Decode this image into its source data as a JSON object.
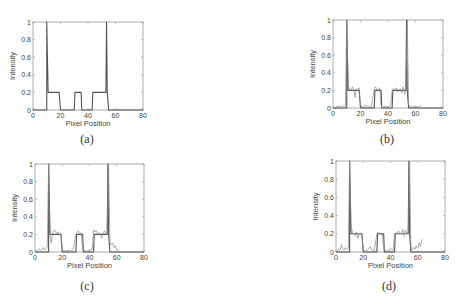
{
  "figure": {
    "panels": [
      {
        "id": "a",
        "caption": "(a)"
      },
      {
        "id": "b",
        "caption": "(b)"
      },
      {
        "id": "c",
        "caption": "(c)"
      },
      {
        "id": "d",
        "caption": "(d)"
      }
    ]
  },
  "chart_data": [
    {
      "type": "line",
      "panel": "(a)",
      "title": "",
      "xlabel": "Pixel Position",
      "ylabel": "Intensity",
      "xlim": [
        0,
        80
      ],
      "ylim": [
        0,
        1
      ],
      "xticks": [
        0,
        20,
        40,
        60,
        80
      ],
      "yticks": [
        0,
        0.2,
        0.4,
        0.6,
        0.8,
        1
      ],
      "ytick_labels": [
        "0",
        "0.2",
        "0.4",
        "0.6",
        "0.8",
        "1"
      ],
      "grid": false,
      "series": [
        {
          "name": "ideal profile",
          "x": [
            0,
            10,
            10,
            11,
            12,
            19,
            20,
            30,
            30.5,
            35,
            35.5,
            43,
            43.5,
            53,
            53.5,
            54,
            55,
            80
          ],
          "y": [
            0,
            0,
            1,
            0.2,
            0.2,
            0.2,
            0,
            0,
            0.2,
            0.2,
            0,
            0,
            0.2,
            0.2,
            1,
            0.2,
            0,
            0
          ]
        }
      ]
    },
    {
      "type": "line",
      "panel": "(b)",
      "title": "",
      "xlabel": "Pixel Position",
      "ylabel": "Intensity",
      "xlim": [
        0,
        80
      ],
      "ylim": [
        0,
        1
      ],
      "xticks": [
        0,
        20,
        40,
        60,
        80
      ],
      "yticks": [
        0,
        0.2,
        0.4,
        0.6,
        0.8,
        1
      ],
      "ytick_labels": [
        "0",
        "0.2",
        "0.4",
        "0.6",
        "0.8",
        "1"
      ],
      "grid": false,
      "series": [
        {
          "name": "ideal profile",
          "x": [
            0,
            10,
            10,
            11,
            12,
            19,
            20,
            30,
            30.5,
            35,
            35.5,
            43,
            43.5,
            53,
            53.5,
            54,
            55,
            80
          ],
          "y": [
            0,
            0,
            1,
            0.2,
            0.2,
            0.2,
            0,
            0,
            0.2,
            0.2,
            0,
            0,
            0.2,
            0.2,
            1,
            0.2,
            0,
            0
          ]
        },
        {
          "name": "reconstruction",
          "x": [
            0,
            2,
            4,
            6,
            8,
            9,
            10,
            11,
            12,
            13,
            14,
            15,
            16,
            17,
            18,
            19,
            20,
            22,
            24,
            26,
            28,
            30,
            31,
            32,
            33,
            34,
            35,
            36,
            38,
            40,
            42,
            43,
            44,
            45,
            46,
            47,
            48,
            49,
            50,
            51,
            52,
            53,
            54,
            55,
            56,
            58,
            60,
            62,
            64
          ],
          "y": [
            0,
            0.01,
            0.02,
            0.01,
            0.03,
            0.02,
            1,
            0.25,
            0.22,
            0.2,
            0.24,
            0.21,
            0.12,
            0.22,
            0.2,
            0.23,
            0.02,
            0.01,
            0.03,
            0.01,
            0.02,
            0.22,
            0.24,
            0.2,
            0.21,
            0.23,
            0.02,
            0.01,
            0.02,
            0.01,
            0.03,
            0.21,
            0.22,
            0.2,
            0.23,
            0.18,
            0.21,
            0.22,
            0.17,
            0.24,
            0.15,
            0.22,
            1,
            0.03,
            0.02,
            0.01,
            0.02,
            0.01,
            0.03
          ]
        }
      ]
    },
    {
      "type": "line",
      "panel": "(c)",
      "title": "",
      "xlabel": "Pixel Position",
      "ylabel": "Intensity",
      "xlim": [
        0,
        80
      ],
      "ylim": [
        0,
        1
      ],
      "xticks": [
        0,
        20,
        40,
        60,
        80
      ],
      "yticks": [
        0,
        0.2,
        0.4,
        0.6,
        0.8,
        1
      ],
      "ytick_labels": [
        "0",
        "0.2",
        "0.4",
        "0.6",
        "0.8",
        "1"
      ],
      "grid": false,
      "series": [
        {
          "name": "ideal profile",
          "x": [
            0,
            10,
            10,
            11,
            12,
            19,
            20,
            30,
            30.5,
            35,
            35.5,
            43,
            43.5,
            53,
            53.5,
            54,
            55,
            80
          ],
          "y": [
            0,
            0,
            1,
            0.2,
            0.2,
            0.2,
            0,
            0,
            0.2,
            0.2,
            0,
            0,
            0.2,
            0.2,
            1,
            0.2,
            0,
            0
          ]
        },
        {
          "name": "reconstruction",
          "x": [
            0,
            2,
            3,
            4,
            5,
            6,
            7,
            8,
            9,
            10,
            11,
            12,
            13,
            14,
            15,
            16,
            17,
            18,
            19,
            20,
            22,
            24,
            26,
            28,
            30,
            31,
            32,
            33,
            34,
            35,
            36,
            38,
            40,
            42,
            43,
            44,
            45,
            46,
            47,
            48,
            49,
            50,
            51,
            52,
            53,
            54,
            55,
            56,
            57,
            58,
            59,
            60,
            62
          ],
          "y": [
            0,
            0.02,
            0.04,
            0.02,
            0.03,
            0.05,
            0.02,
            0.04,
            0.06,
            1,
            0.18,
            0.1,
            0.22,
            0.25,
            0.24,
            0.2,
            0.23,
            0.2,
            0.21,
            0.03,
            0.01,
            0.02,
            0.01,
            0.03,
            0.2,
            0.23,
            0.24,
            0.2,
            0.22,
            0.03,
            0.02,
            0.01,
            0.02,
            0.03,
            0.25,
            0.23,
            0.24,
            0.19,
            0.22,
            0.2,
            0.16,
            0.21,
            0.24,
            0.2,
            0.22,
            1,
            0.12,
            0.08,
            0.1,
            0.05,
            0.07,
            0.03,
            0.02
          ]
        }
      ]
    },
    {
      "type": "line",
      "panel": "(d)",
      "title": "",
      "xlabel": "Pixel Position",
      "ylabel": "Intensity",
      "xlim": [
        0,
        80
      ],
      "ylim": [
        0,
        1
      ],
      "xticks": [
        0,
        20,
        40,
        60,
        80
      ],
      "yticks": [
        0,
        0.2,
        0.4,
        0.6,
        0.8,
        1
      ],
      "ytick_labels": [
        "0",
        "0.2",
        "0.4",
        "0.6",
        "0.8",
        "1"
      ],
      "grid": false,
      "series": [
        {
          "name": "ideal profile",
          "x": [
            0,
            10,
            10,
            11,
            12,
            19,
            20,
            30,
            30.5,
            35,
            35.5,
            43,
            43.5,
            53,
            53.5,
            54,
            55,
            80
          ],
          "y": [
            0,
            0,
            1,
            0.2,
            0.2,
            0.2,
            0,
            0,
            0.2,
            0.2,
            0,
            0,
            0.2,
            0.2,
            1,
            0.2,
            0,
            0
          ]
        },
        {
          "name": "reconstruction",
          "x": [
            0,
            2,
            3,
            4,
            5,
            6,
            7,
            8,
            9,
            10,
            11,
            12,
            13,
            14,
            15,
            16,
            17,
            18,
            19,
            20,
            22,
            24,
            25,
            26,
            28,
            30,
            31,
            32,
            33,
            34,
            35,
            36,
            38,
            40,
            42,
            43,
            44,
            45,
            46,
            47,
            48,
            49,
            50,
            51,
            52,
            53,
            54,
            55,
            56,
            57,
            58,
            59,
            60,
            61,
            62,
            63
          ],
          "y": [
            0,
            0.03,
            0.02,
            0.08,
            0.03,
            0.02,
            0.05,
            0.03,
            0.04,
            1,
            0.28,
            0.22,
            0.2,
            0.18,
            0.22,
            0.15,
            0.2,
            0.21,
            0.19,
            0.02,
            0.01,
            0.04,
            0.06,
            0.03,
            0.01,
            0.2,
            0.22,
            0.21,
            0.19,
            0.2,
            0.03,
            0.02,
            0.01,
            0.04,
            0.02,
            0.21,
            0.2,
            0.22,
            0.23,
            0.2,
            0.21,
            0.25,
            0.18,
            0.24,
            0.2,
            0.22,
            1,
            0.04,
            0.02,
            0.05,
            0.03,
            0.07,
            0.04,
            0.1,
            0.06,
            0.14
          ]
        }
      ]
    }
  ]
}
